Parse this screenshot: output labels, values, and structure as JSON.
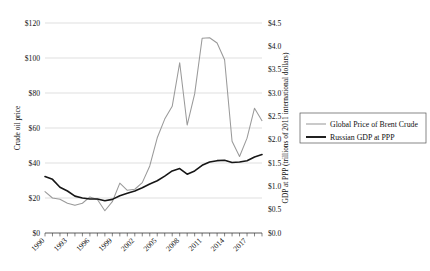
{
  "chart_data": {
    "type": "line",
    "title": "",
    "xlabel": "",
    "ylabel": "Crude oil price",
    "y2label": "GDP at PPP (trillions of 2011 international dollars)",
    "grid": true,
    "legend_position": "right",
    "xlim": [
      1990,
      2019
    ],
    "ylim": [
      0,
      120
    ],
    "y2lim": [
      0.0,
      4.5
    ],
    "x_tick_labels": [
      "1990",
      "1993",
      "1996",
      "1999",
      "2002",
      "2005",
      "2008",
      "2011",
      "2014",
      "2017"
    ],
    "x_tick_values": [
      1990,
      1993,
      1996,
      1999,
      2002,
      2005,
      2008,
      2011,
      2014,
      2017
    ],
    "y_tick_labels": [
      "$0",
      "$20",
      "$40",
      "$60",
      "$80",
      "$100",
      "$120"
    ],
    "y_tick_values": [
      0,
      20,
      40,
      60,
      80,
      100,
      120
    ],
    "y2_tick_labels": [
      "$0.0",
      "$0.5",
      "$1.0",
      "$1.5",
      "$2.0",
      "$2.5",
      "$3.0",
      "$3.5",
      "$4.0",
      "$4.5"
    ],
    "y2_tick_values": [
      0.0,
      0.5,
      1.0,
      1.5,
      2.0,
      2.5,
      3.0,
      3.5,
      4.0,
      4.5
    ],
    "x": [
      1990,
      1991,
      1992,
      1993,
      1994,
      1995,
      1996,
      1997,
      1998,
      1999,
      2000,
      2001,
      2002,
      2003,
      2004,
      2005,
      2006,
      2007,
      2008,
      2009,
      2010,
      2011,
      2012,
      2013,
      2014,
      2015,
      2016,
      2017,
      2018,
      2019
    ],
    "series": [
      {
        "name": "Global Price of Brent Crude",
        "axis": "left",
        "color": "#9a9a9a",
        "values": [
          23.7,
          20.0,
          19.3,
          17.0,
          15.8,
          17.0,
          20.6,
          19.1,
          12.7,
          17.9,
          28.5,
          24.4,
          25.0,
          28.8,
          38.3,
          54.4,
          65.1,
          72.4,
          97.3,
          61.7,
          79.5,
          111.3,
          111.6,
          108.6,
          99.0,
          52.4,
          43.7,
          54.2,
          71.3,
          64.2
        ]
      },
      {
        "name": "Russian GDP at PPP",
        "axis": "right",
        "color": "#161616",
        "values": [
          1.21,
          1.15,
          0.98,
          0.9,
          0.79,
          0.75,
          0.73,
          0.73,
          0.69,
          0.72,
          0.8,
          0.85,
          0.9,
          0.97,
          1.05,
          1.12,
          1.22,
          1.33,
          1.38,
          1.26,
          1.33,
          1.45,
          1.52,
          1.55,
          1.56,
          1.51,
          1.52,
          1.55,
          1.63,
          1.68
        ]
      }
    ],
    "legend": [
      {
        "label": "Global Price of Brent Crude",
        "color": "#9a9a9a",
        "weight": "thin"
      },
      {
        "label": "Russian GDP at PPP",
        "color": "#161616",
        "weight": "thick"
      }
    ]
  }
}
